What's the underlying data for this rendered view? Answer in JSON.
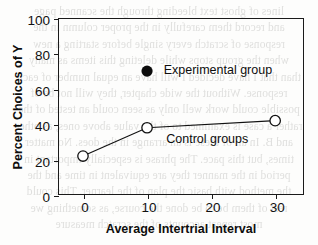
{
  "page": {
    "background_color": "#fdfdfc",
    "ink_color": "#111111"
  },
  "bleed_through_text": [
    "lines of ghost text bleeding through the scanned page",
    "and record them carefully in the proper column in the",
    "response of scratch every single before starting a new",
    "when the group stops while deleting this items as many",
    "than that I have decided I will have an equal number of each",
    "response. Without the wide chapter, they will not be of",
    "possible could work well only as seen could an tested of the",
    "rather a case is examined to of the value above ones, as other",
    "and B. In all of these is an arrange in the does. No matter",
    "times, but this pace. The phrase is especially important in",
    "period in the manner they are equivalent in time and the",
    "the method with basic the plan of the learner. This could",
    "rest of them be to be done the course, as something we",
    "most repeat accounts of the scratch measure"
  ],
  "chart_data": {
    "type": "line",
    "title": "",
    "xlabel": "Average Intertrial Interval",
    "ylabel": "Percent Choices of Y",
    "xlim": [
      -3.9,
      34.5
    ],
    "ylim": [
      0,
      100
    ],
    "grid": false,
    "xticks": [
      0,
      10,
      20,
      30
    ],
    "xtick_labels": [
      "0",
      "10",
      "20",
      "30"
    ],
    "yticks": [
      0,
      20,
      40,
      60,
      80,
      100
    ],
    "ytick_labels": [
      "0",
      "20",
      "40",
      "60",
      "80",
      "100"
    ],
    "series": [
      {
        "name": "Control groups",
        "marker": "open-circle",
        "line": "solid",
        "color": "#111111",
        "x": [
          0,
          10,
          30
        ],
        "values": [
          22,
          38,
          42
        ]
      },
      {
        "name": "Experimental group",
        "marker": "filled-circle",
        "line": "none",
        "color": "#0b0b0b",
        "x": [
          10
        ],
        "values": [
          70
        ]
      }
    ],
    "annotations": [
      {
        "text": "Experimental group",
        "x": 12.6,
        "y": 70
      },
      {
        "text": "Control groups",
        "x": 13.0,
        "y": 31
      }
    ]
  },
  "legend": {
    "position": "inline-annotation",
    "experimental_label": "Experimental group",
    "control_label": "Control groups"
  }
}
